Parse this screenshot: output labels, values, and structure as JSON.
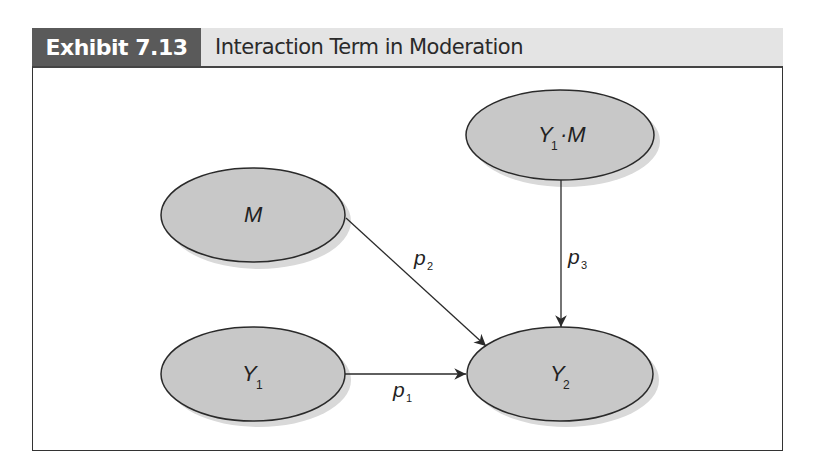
{
  "header": {
    "exhibit_label": "Exhibit 7.13",
    "title": "Interaction Term in Moderation"
  },
  "diagram": {
    "nodes": [
      {
        "id": "interaction",
        "label": "Y",
        "subscript": "1",
        "suffix": "·M",
        "cx": 560,
        "cy": 135
      },
      {
        "id": "moderator",
        "label": "M",
        "subscript": "",
        "suffix": "",
        "cx": 253,
        "cy": 215
      },
      {
        "id": "predictor",
        "label": "Y",
        "subscript": "1",
        "suffix": "",
        "cx": 253,
        "cy": 374
      },
      {
        "id": "outcome",
        "label": "Y",
        "subscript": "2",
        "suffix": "",
        "cx": 560,
        "cy": 374
      }
    ],
    "edges": [
      {
        "from": "predictor",
        "to": "outcome",
        "label": "p",
        "subscript": "1"
      },
      {
        "from": "moderator",
        "to": "outcome",
        "label": "p",
        "subscript": "2"
      },
      {
        "from": "interaction",
        "to": "outcome",
        "label": "p",
        "subscript": "3"
      }
    ]
  },
  "colors": {
    "node_fill": "#c8c8c8",
    "node_shadow": "#d9d9d9",
    "stroke": "#2a2a2a",
    "exhibit_label_bg": "#5a5a5a",
    "header_bg": "#e4e4e4"
  }
}
